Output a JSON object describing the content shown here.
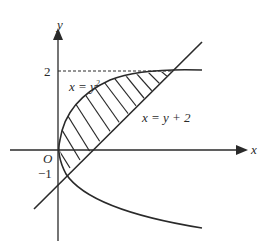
{
  "diagram": {
    "axes": {
      "x_label": "x",
      "y_label": "y",
      "origin_label": "O"
    },
    "ticks": {
      "y_top": "2",
      "y_bottom": "−1"
    },
    "curves": {
      "parabola_label_lhs": "x = y",
      "parabola_label_exp": "2",
      "line_label": "x = y + 2"
    },
    "colors": {
      "stroke": "#2a2a2a",
      "background": "#ffffff"
    }
  }
}
